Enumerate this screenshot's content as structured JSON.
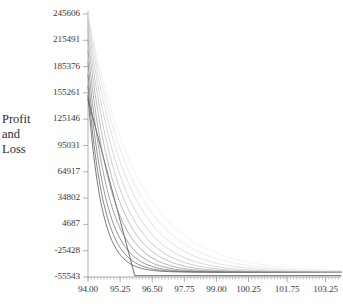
{
  "chart_data": {
    "type": "line",
    "title": "",
    "subtitle": "",
    "xlabel": "",
    "ylabel": "Profit and Loss",
    "ylabel_lines": [
      "Profit",
      "and",
      "Loss"
    ],
    "grid": false,
    "legend": "none",
    "xlim": [
      94.0,
      103.85
    ],
    "ylim": [
      -55543,
      245606
    ],
    "x_ticks": [
      94.0,
      95.25,
      96.5,
      97.75,
      99.0,
      100.25,
      101.75,
      103.25
    ],
    "x_tick_labels": [
      "94.00",
      "95.25",
      "96.50",
      "97.75",
      "99.00",
      "100.25",
      "101.75",
      "103.25"
    ],
    "y_ticks": [
      245606,
      215491,
      185376,
      155261,
      125146,
      95031,
      64917,
      34802,
      4687,
      -25428,
      -55543
    ],
    "y_tick_labels": [
      "245606",
      "215491",
      "185376",
      "155261",
      "125146",
      "95031",
      "64917",
      "34802",
      "4687",
      "-25428",
      "-55543"
    ],
    "y_tick_step": 30115,
    "minor_ticks_x": true,
    "axis_color": "#9a9a9a",
    "series": [
      {
        "name": "curve-1",
        "color": "#4a4a4a",
        "opacity": 0.95,
        "x_start": 94.0,
        "y_start": 148000,
        "x_floor": 95.82,
        "shape": "steep-linear",
        "decay": 0.0
      },
      {
        "name": "curve-2",
        "color": "#565656",
        "opacity": 0.92,
        "x_start": 94.0,
        "y_start": 152000,
        "x_floor": 103.85,
        "shape": "exponential-decay",
        "decay": 1.85
      },
      {
        "name": "curve-3",
        "color": "#606060",
        "opacity": 0.88,
        "x_start": 94.0,
        "y_start": 163000,
        "x_floor": 103.85,
        "shape": "exponential-decay",
        "decay": 1.62
      },
      {
        "name": "curve-4",
        "color": "#6b6b6b",
        "opacity": 0.84,
        "x_start": 94.0,
        "y_start": 176000,
        "x_floor": 103.85,
        "shape": "exponential-decay",
        "decay": 1.42
      },
      {
        "name": "curve-5",
        "color": "#787878",
        "opacity": 0.8,
        "x_start": 94.0,
        "y_start": 190000,
        "x_floor": 103.85,
        "shape": "exponential-decay",
        "decay": 1.25
      },
      {
        "name": "curve-6",
        "color": "#878787",
        "opacity": 0.76,
        "x_start": 94.0,
        "y_start": 204000,
        "x_floor": 103.85,
        "shape": "exponential-decay",
        "decay": 1.1
      },
      {
        "name": "curve-7",
        "color": "#969696",
        "opacity": 0.72,
        "x_start": 94.0,
        "y_start": 217000,
        "x_floor": 103.85,
        "shape": "exponential-decay",
        "decay": 0.97
      },
      {
        "name": "curve-8",
        "color": "#a6a6a6",
        "opacity": 0.68,
        "x_start": 94.0,
        "y_start": 228000,
        "x_floor": 103.85,
        "shape": "exponential-decay",
        "decay": 0.86
      },
      {
        "name": "curve-9",
        "color": "#b6b6b6",
        "opacity": 0.64,
        "x_start": 94.0,
        "y_start": 237000,
        "x_floor": 103.85,
        "shape": "exponential-decay",
        "decay": 0.76
      },
      {
        "name": "curve-10",
        "color": "#c4c4c4",
        "opacity": 0.6,
        "x_start": 94.0,
        "y_start": 243000,
        "x_floor": 103.85,
        "shape": "exponential-decay",
        "decay": 0.67
      },
      {
        "name": "curve-11",
        "color": "#d2d2d2",
        "opacity": 0.56,
        "x_start": 94.0,
        "y_start": 245606,
        "x_floor": 103.85,
        "shape": "exponential-decay",
        "decay": 0.59
      },
      {
        "name": "curve-12",
        "color": "#dedede",
        "opacity": 0.52,
        "x_start": 94.0,
        "y_start": 245606,
        "x_floor": 103.85,
        "shape": "exponential-decay",
        "decay": 0.52
      }
    ],
    "asymptote_value": -50000
  }
}
